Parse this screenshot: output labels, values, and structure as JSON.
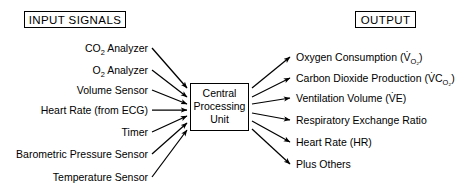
{
  "diagram": {
    "title_left": "INPUT SIGNALS",
    "title_right": "OUTPUT",
    "center_node": {
      "line1": "Central",
      "line2": "Processing",
      "line3": "Unit"
    },
    "inputs": [
      {
        "label": "CO2 Analyzer",
        "base": "CO",
        "sub": "2",
        "tail": " Analyzer"
      },
      {
        "label": "O2 Analyzer",
        "base": "O",
        "sub": "2",
        "tail": " Analyzer"
      },
      {
        "label": "Volume Sensor",
        "base": "Volume Sensor",
        "sub": "",
        "tail": ""
      },
      {
        "label": "Heart Rate (from ECG)",
        "base": "Heart Rate (from ECG)",
        "sub": "",
        "tail": ""
      },
      {
        "label": "Timer",
        "base": "Timer",
        "sub": "",
        "tail": ""
      },
      {
        "label": "Barometric Pressure Sensor",
        "base": "Barometric Pressure Sensor",
        "sub": "",
        "tail": ""
      },
      {
        "label": "Temperature Sensor",
        "base": "Temperature Sensor",
        "sub": "",
        "tail": ""
      }
    ],
    "outputs": [
      {
        "label": "Oxygen Consumption (VO2)",
        "prefix": "Oxygen Consumption (",
        "sym": "V",
        "dot": true,
        "symtail": "",
        "sub": "O2",
        "suffix": ")"
      },
      {
        "label": "Carbon Dioxide Production (VCO2)",
        "prefix": "Carbon Dioxide Production (",
        "sym": "V",
        "dot": true,
        "symtail": "C",
        "sub": "O2",
        "suffix": ")"
      },
      {
        "label": "Ventilation Volume (VE)",
        "prefix": "Ventilation Volume (",
        "sym": "V",
        "dot": true,
        "symtail": "E",
        "sub": "",
        "suffix": ")"
      },
      {
        "label": "Respiratory Exchange Ratio",
        "prefix": "Respiratory Exchange Ratio",
        "sym": "",
        "dot": false,
        "symtail": "",
        "sub": "",
        "suffix": ""
      },
      {
        "label": "Heart Rate (HR)",
        "prefix": "Heart Rate (HR)",
        "sym": "",
        "dot": false,
        "symtail": "",
        "sub": "",
        "suffix": ""
      },
      {
        "label": "Plus Others",
        "prefix": "Plus Others",
        "sym": "",
        "dot": false,
        "symtail": "",
        "sub": "",
        "suffix": ""
      }
    ],
    "colors": {
      "stroke": "#000000",
      "background": "#ffffff"
    }
  }
}
